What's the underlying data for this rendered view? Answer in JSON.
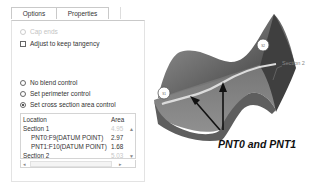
{
  "tabs": [
    {
      "label": "Options",
      "active": true
    },
    {
      "label": "Properties",
      "active": false
    }
  ],
  "options": {
    "cap_ends": {
      "label": "Cap ends",
      "enabled": false,
      "checked": false
    },
    "adjust_tangency": {
      "label": "Adjust to keep tangency",
      "checked": false
    }
  },
  "blend_control": {
    "options": [
      {
        "label": "No blend control",
        "selected": false
      },
      {
        "label": "Set perimeter control",
        "selected": false
      },
      {
        "label": "Set cross section area control",
        "selected": true
      }
    ]
  },
  "table": {
    "columns": [
      "Location",
      "Area"
    ],
    "rows": [
      {
        "location": "Section 1",
        "area": "4.95",
        "indent": false,
        "greyed": true
      },
      {
        "location": "PNT0:F9(DATUM POINT)",
        "area": "2.97",
        "indent": true,
        "greyed": false
      },
      {
        "location": "PNT1:F10(DATUM POINT)",
        "area": "1.68",
        "indent": true,
        "greyed": false
      },
      {
        "location": "Section 2",
        "area": "5.03",
        "indent": false,
        "greyed": true
      }
    ]
  },
  "figure": {
    "callout": "PNT0 and PNT1",
    "section_label": "Section 2",
    "colors": {
      "surface_dark": "#4a4a4a",
      "surface_light": "#8c8c8c",
      "curve": "#d8d8d8"
    }
  }
}
